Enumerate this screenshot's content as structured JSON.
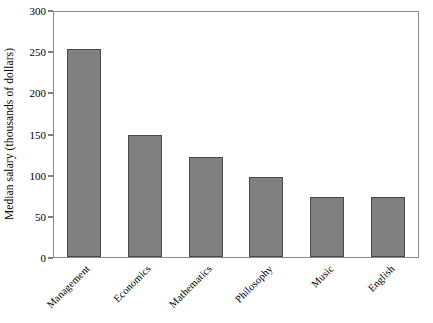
{
  "chart_data": {
    "type": "bar",
    "title": "",
    "xlabel": "",
    "ylabel": "Median salary (thousands of dollars)",
    "categories": [
      "Management",
      "Economics",
      "Mathematics",
      "Philosophy",
      "Music",
      "English"
    ],
    "values": [
      255,
      150,
      123,
      98,
      74,
      73
    ],
    "ylim": [
      0,
      300
    ],
    "yticks": [
      0,
      50,
      100,
      150,
      200,
      250,
      300
    ],
    "ytick_labels": [
      "0",
      "50",
      "100",
      "150",
      "200",
      "250",
      "300"
    ],
    "grid": false,
    "legend": false,
    "bar_color": "#808080",
    "bar_edge_color": "#4a4a4a",
    "frame_color": "#8a8a8a",
    "xtick_label_rotation": -45
  }
}
